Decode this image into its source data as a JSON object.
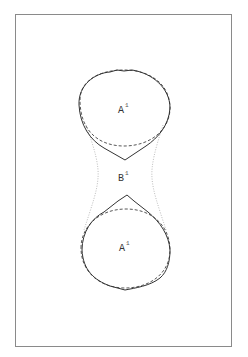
{
  "diagram": {
    "frame": {
      "x": 15,
      "y": 14,
      "width": 217,
      "height": 333,
      "stroke": "#8a8a8a"
    },
    "colors": {
      "solid": "#333333",
      "dashed": "#444444",
      "dotted": "#aaaaaa"
    },
    "regions": [
      {
        "id": "upper",
        "label": "A",
        "superscript": "1",
        "x": 118,
        "y": 113
      },
      {
        "id": "neck",
        "label": "B",
        "superscript": "1",
        "x": 118,
        "y": 181
      },
      {
        "id": "lower",
        "label": "A",
        "superscript": "1",
        "x": 119,
        "y": 251
      }
    ]
  }
}
